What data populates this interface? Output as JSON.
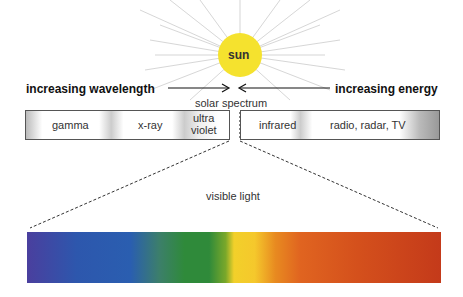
{
  "sun": {
    "label": "sun",
    "color": "#f5e22e"
  },
  "labels": {
    "left_arrow": "increasing wavelength",
    "right_arrow": "increasing energy",
    "solar_spectrum": "solar spectrum",
    "visible_light": "visible light"
  },
  "spectrum_bands": [
    {
      "label": "gamma"
    },
    {
      "label": "x-ray"
    },
    {
      "label_line1": "ultra",
      "label_line2": "violet"
    },
    {
      "label": "infrared"
    },
    {
      "label": "radio, radar, TV"
    }
  ],
  "visible_spectrum_colors": [
    "#4a3f9e",
    "#2a5eb0",
    "#2f8a3a",
    "#f2d02a",
    "#e06420",
    "#c43a1a"
  ]
}
